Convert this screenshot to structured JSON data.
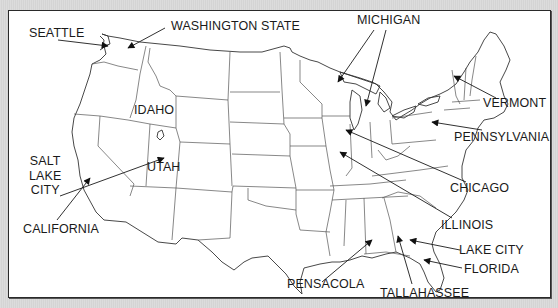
{
  "map": {
    "title": "United States map with labeled locations",
    "background_color": "#d9d9d9",
    "panel_color": "#ffffff",
    "border_color": "#2a2a2a",
    "labels": [
      {
        "id": "seattle",
        "text": "SEATTLE",
        "kind": "city"
      },
      {
        "id": "washington-state",
        "text": "WASHINGTON STATE",
        "kind": "state"
      },
      {
        "id": "idaho",
        "text": "IDAHO",
        "kind": "state"
      },
      {
        "id": "salt-lake-city",
        "text": "SALT\nLAKE\nCITY",
        "kind": "city"
      },
      {
        "id": "utah",
        "text": "UTAH",
        "kind": "state"
      },
      {
        "id": "california",
        "text": "CALIFORNIA",
        "kind": "state"
      },
      {
        "id": "michigan",
        "text": "MICHIGAN",
        "kind": "state"
      },
      {
        "id": "vermont",
        "text": "VERMONT",
        "kind": "state"
      },
      {
        "id": "pennsylvania",
        "text": "PENNSYLVANIA",
        "kind": "state"
      },
      {
        "id": "chicago",
        "text": "CHICAGO",
        "kind": "city"
      },
      {
        "id": "illinois",
        "text": "ILLINOIS",
        "kind": "state"
      },
      {
        "id": "lake-city",
        "text": "LAKE CITY",
        "kind": "city"
      },
      {
        "id": "florida",
        "text": "FLORIDA",
        "kind": "state"
      },
      {
        "id": "pensacola",
        "text": "PENSACOLA",
        "kind": "city"
      },
      {
        "id": "tallahassee",
        "text": "TALLAHASSEE",
        "kind": "city"
      }
    ]
  }
}
